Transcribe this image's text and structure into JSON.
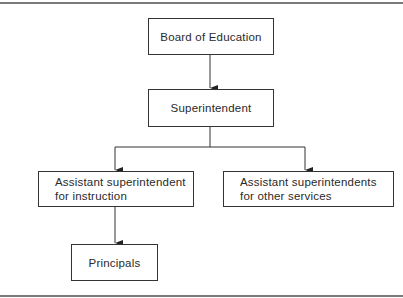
{
  "diagram": {
    "type": "org-chart",
    "nodes": {
      "board": {
        "label": "Board of Education"
      },
      "superintendent": {
        "label": "Superintendent"
      },
      "asst_instruction": {
        "line1": "Assistant superintendent",
        "line2": "for instruction"
      },
      "asst_other": {
        "line1": "Assistant superintendents",
        "line2": "for other services"
      },
      "principals": {
        "label": "Principals"
      }
    },
    "edges": [
      {
        "from": "Board of Education",
        "to": "Superintendent"
      },
      {
        "from": "Superintendent",
        "to": "Assistant superintendent for instruction"
      },
      {
        "from": "Superintendent",
        "to": "Assistant superintendents for other services"
      },
      {
        "from": "Assistant superintendent for instruction",
        "to": "Principals"
      }
    ],
    "colors": {
      "line": "#333333",
      "rule": "#7a7a7a",
      "background": "#ffffff"
    }
  }
}
